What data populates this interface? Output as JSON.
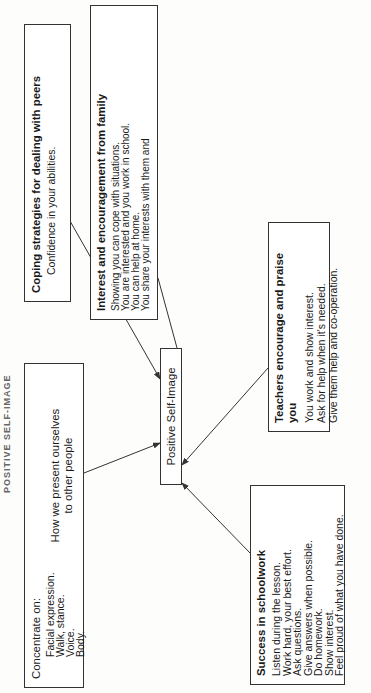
{
  "page_title": "POSITIVE SELF-IMAGE",
  "center": {
    "label": "Positive Self-Image"
  },
  "boxes": {
    "coping": {
      "title": "Coping strategies for dealing with peers",
      "lines": [
        "Confidence in your abilities.",
        "Depend on yourself.",
        "Interested in them."
      ]
    },
    "family": {
      "title": "Interest and encouragement from family",
      "lines": [
        "Showing you can cope with situations.",
        "You are interested and you work in school.",
        "You can help at home.",
        "You share your interests with them and",
        "enjoy their co-operation."
      ]
    },
    "concentrate": {
      "title": "Concentrate on:",
      "lines": [
        "Facial expression.",
        "Walk, stance.",
        "Voice.",
        "Body."
      ],
      "brace_label": [
        "How we present ourselves",
        "to other people"
      ]
    },
    "teachers": {
      "title": "Teachers encourage and praise you",
      "lines": [
        "You work and show interest.",
        "Ask for help when it's needed.",
        "Give them help and co-operation."
      ]
    },
    "success": {
      "title": "Success in schoolwork",
      "lines": [
        "Listen during the lesson.",
        "Work hard, your best effort.",
        "Ask questions.",
        "Give answers when possible.",
        "Do homework.",
        "Show interest.",
        "Feel proud of what you have done."
      ]
    }
  },
  "colors": {
    "line": "#333333",
    "text": "#1a1a1a",
    "paper": "#fdfdfc"
  }
}
